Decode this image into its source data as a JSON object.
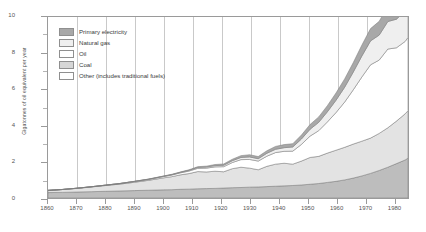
{
  "chart_data": {
    "type": "area",
    "stacked": true,
    "title": "",
    "xlabel": "",
    "ylabel": "Gigatonnes of oil equivalent per year",
    "xlim": [
      1860,
      1985
    ],
    "ylim": [
      0,
      10
    ],
    "y_ticks": [
      0,
      2,
      4,
      6,
      8,
      10
    ],
    "y_minor_ticks": [
      1,
      3,
      5,
      7,
      9
    ],
    "x_ticks": [
      1860,
      1870,
      1880,
      1890,
      1900,
      1910,
      1920,
      1930,
      1940,
      1950,
      1960,
      1970,
      1980
    ],
    "grid": "vertical",
    "legend_position": "upper-left",
    "x": [
      1860,
      1865,
      1870,
      1875,
      1880,
      1885,
      1890,
      1895,
      1900,
      1903,
      1906,
      1909,
      1912,
      1915,
      1918,
      1921,
      1924,
      1927,
      1930,
      1933,
      1936,
      1939,
      1942,
      1945,
      1948,
      1951,
      1954,
      1957,
      1960,
      1963,
      1966,
      1969,
      1972,
      1975,
      1978,
      1981,
      1984,
      1985
    ],
    "series": [
      {
        "name": "Other (includes traditional fuels)",
        "color": "#bdbdbd",
        "values": [
          0.3,
          0.31,
          0.33,
          0.35,
          0.37,
          0.39,
          0.41,
          0.43,
          0.45,
          0.46,
          0.48,
          0.49,
          0.51,
          0.52,
          0.53,
          0.55,
          0.57,
          0.58,
          0.6,
          0.61,
          0.63,
          0.65,
          0.67,
          0.69,
          0.72,
          0.76,
          0.8,
          0.86,
          0.92,
          1.0,
          1.1,
          1.22,
          1.36,
          1.52,
          1.7,
          1.9,
          2.1,
          2.2
        ]
      },
      {
        "name": "Coal",
        "color": "#e3e3e3",
        "values": [
          0.12,
          0.16,
          0.2,
          0.26,
          0.32,
          0.38,
          0.46,
          0.55,
          0.66,
          0.72,
          0.8,
          0.86,
          0.95,
          0.92,
          0.95,
          0.9,
          1.05,
          1.12,
          1.05,
          0.95,
          1.12,
          1.22,
          1.25,
          1.18,
          1.32,
          1.48,
          1.5,
          1.62,
          1.72,
          1.8,
          1.88,
          1.92,
          1.95,
          2.05,
          2.18,
          2.35,
          2.55,
          2.62
        ]
      },
      {
        "name": "Oil",
        "color": "#ffffff",
        "values": [
          0.0,
          0.0,
          0.01,
          0.01,
          0.02,
          0.03,
          0.04,
          0.05,
          0.07,
          0.09,
          0.11,
          0.14,
          0.18,
          0.21,
          0.24,
          0.28,
          0.34,
          0.42,
          0.48,
          0.48,
          0.56,
          0.64,
          0.66,
          0.72,
          0.92,
          1.18,
          1.42,
          1.72,
          2.08,
          2.5,
          3.0,
          3.55,
          4.05,
          4.05,
          4.35,
          4.05,
          4.0,
          4.05
        ]
      },
      {
        "name": "Natural gas",
        "color": "#efefef",
        "values": [
          0.0,
          0.0,
          0.0,
          0.0,
          0.0,
          0.0,
          0.01,
          0.01,
          0.02,
          0.02,
          0.03,
          0.04,
          0.05,
          0.06,
          0.07,
          0.08,
          0.1,
          0.12,
          0.14,
          0.13,
          0.16,
          0.18,
          0.2,
          0.23,
          0.3,
          0.38,
          0.46,
          0.56,
          0.68,
          0.82,
          0.98,
          1.16,
          1.32,
          1.38,
          1.52,
          1.58,
          1.68,
          1.72
        ]
      },
      {
        "name": "Primary electricity",
        "color": "#a8a8a8",
        "values": [
          0.0,
          0.0,
          0.0,
          0.0,
          0.0,
          0.0,
          0.0,
          0.01,
          0.01,
          0.02,
          0.02,
          0.03,
          0.04,
          0.05,
          0.06,
          0.07,
          0.08,
          0.1,
          0.12,
          0.12,
          0.14,
          0.16,
          0.17,
          0.18,
          0.22,
          0.26,
          0.3,
          0.34,
          0.4,
          0.46,
          0.52,
          0.6,
          0.68,
          0.76,
          0.86,
          0.96,
          1.06,
          1.12
        ]
      }
    ]
  },
  "legend": {
    "items": [
      {
        "label": "Primary electricity",
        "color": "#a8a8a8"
      },
      {
        "label": "Natural gas",
        "color": "#efefef"
      },
      {
        "label": "Oil",
        "color": "#ffffff"
      },
      {
        "label": "Coal",
        "color": "#d6d6d6"
      },
      {
        "label": "Other (includes traditional fuels)",
        "color": "#ffffff"
      }
    ]
  },
  "axes": {
    "y_title": "Gigatonnes of oil equivalent per year",
    "y_labels": [
      "0",
      "2",
      "4",
      "6",
      "8",
      "10"
    ],
    "x_labels": [
      "1860",
      "1870",
      "1880",
      "1890",
      "1900",
      "1910",
      "1920",
      "1930",
      "1940",
      "1950",
      "1960",
      "1970",
      "1980"
    ]
  }
}
